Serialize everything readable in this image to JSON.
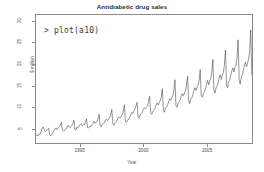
{
  "chart_data": {
    "type": "line",
    "title": "Antidiabetic drug sales",
    "xlabel": "Year",
    "ylabel": "$ million",
    "grid": false,
    "legend": "none",
    "xlim": [
      1991.5,
      2008.6
    ],
    "ylim": [
      1.5,
      31.5
    ],
    "xticks": [
      "1995",
      "2000",
      "2005"
    ],
    "xtick_values": [
      1995,
      2000,
      2005
    ],
    "yticks": [
      "5",
      "10",
      "15",
      "20",
      "25",
      "30"
    ],
    "ytick_values": [
      5,
      10,
      15,
      20,
      25,
      30
    ],
    "series_name": "a10",
    "x_start": 1991.5,
    "x_step": 0.0833333,
    "values": [
      3.53,
      3.18,
      3.25,
      3.61,
      3.57,
      4.31,
      5.09,
      5.21,
      4.43,
      4.15,
      4.52,
      4.65,
      4.97,
      3.52,
      3.18,
      3.51,
      3.84,
      4.37,
      4.75,
      5.04,
      4.65,
      5.0,
      5.19,
      5.59,
      6.32,
      4.52,
      4.29,
      4.39,
      4.79,
      4.92,
      5.48,
      5.54,
      5.18,
      5.29,
      5.53,
      6.06,
      6.87,
      4.58,
      4.58,
      5.19,
      5.13,
      5.52,
      5.84,
      6.02,
      5.55,
      5.82,
      5.76,
      6.44,
      7.19,
      5.08,
      5.02,
      5.4,
      5.31,
      5.81,
      6.04,
      6.6,
      6.19,
      6.22,
      6.6,
      7.21,
      8.25,
      5.47,
      5.3,
      5.88,
      6.18,
      6.27,
      6.9,
      7.09,
      6.77,
      7.14,
      7.5,
      8.1,
      9.34,
      6.08,
      5.65,
      6.26,
      6.53,
      6.74,
      7.44,
      7.59,
      7.39,
      7.83,
      8.1,
      9.01,
      10.46,
      6.45,
      6.34,
      6.94,
      7.01,
      7.46,
      8.12,
      8.65,
      8.46,
      9.03,
      9.46,
      10.13,
      11.04,
      7.48,
      7.39,
      8.09,
      8.38,
      8.71,
      9.46,
      9.78,
      9.49,
      9.88,
      10.18,
      11.28,
      12.45,
      8.46,
      8.2,
      8.93,
      9.25,
      9.59,
      10.31,
      10.93,
      10.42,
      10.9,
      11.44,
      12.21,
      14.21,
      9.15,
      8.71,
      9.81,
      9.93,
      10.44,
      11.17,
      11.84,
      11.52,
      12.15,
      12.6,
      13.97,
      16.3,
      10.09,
      9.85,
      10.88,
      11.17,
      11.62,
      12.62,
      13.09,
      12.49,
      13.11,
      13.77,
      14.98,
      17.14,
      11.36,
      10.71,
      11.71,
      12.08,
      12.83,
      13.71,
      14.47,
      13.82,
      14.61,
      15.0,
      16.24,
      18.7,
      12.49,
      12.25,
      13.07,
      13.52,
      14.16,
      15.32,
      16.15,
      15.17,
      16.12,
      16.48,
      18.22,
      21.11,
      13.86,
      13.17,
      14.41,
      14.89,
      15.56,
      16.85,
      17.5,
      16.42,
      17.42,
      18.02,
      19.92,
      23.29,
      15.02,
      14.47,
      15.94,
      16.14,
      17.34,
      18.43,
      19.11,
      18.12,
      19.25,
      19.77,
      21.62,
      25.67,
      16.34,
      15.3,
      16.98,
      17.5,
      18.44,
      19.75,
      20.46,
      19.39,
      20.33,
      21.15,
      23.1,
      28.04,
      17.61,
      16.85,
      18.35,
      19.24,
      20.12,
      21.8,
      22.36,
      21.24,
      22.57,
      23.17,
      25.25,
      29.66,
      19.09,
      18.11,
      19.63,
      20.13,
      21.31,
      22.43,
      23.01,
      22.5,
      23.28,
      24.04,
      26.1,
      23.49,
      20.21,
      19.15,
      20.55,
      21.35,
      22.05,
      23.15,
      23.9,
      22.75,
      23.55,
      24.15,
      20.12
    ]
  },
  "console_overlay": {
    "text": "> plot(a10)"
  }
}
